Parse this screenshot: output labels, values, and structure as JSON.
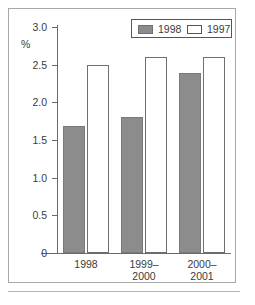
{
  "chart_data": {
    "type": "bar",
    "title": "",
    "subtitle": "",
    "xlabel": "",
    "ylabel": "%",
    "ylim": [
      0,
      3.0
    ],
    "yticks": [
      "0",
      "0.5",
      "1.0",
      "1.5",
      "2.0",
      "2.5",
      "3.0"
    ],
    "ytick_values": [
      0,
      0.5,
      1.0,
      1.5,
      2.0,
      2.5,
      3.0
    ],
    "grid": false,
    "legend_position": "top-right",
    "categories": [
      "1998",
      "1999–2000",
      "2000–2001"
    ],
    "category_lines": [
      [
        "1998"
      ],
      [
        "1999–",
        "2000"
      ],
      [
        "2000–",
        "2001"
      ]
    ],
    "series": [
      {
        "name": "1998",
        "style": "filled",
        "color": "#8c8c8c",
        "values": [
          1.68,
          1.8,
          2.39
        ]
      },
      {
        "name": "1997",
        "style": "open",
        "color": "#ffffff",
        "values": [
          2.49,
          2.6,
          2.6
        ]
      }
    ]
  },
  "legend": {
    "entries": [
      {
        "label": "1998",
        "swatch": "filled-gray-swatch"
      },
      {
        "label": "1997",
        "swatch": "open-white-swatch"
      }
    ]
  },
  "axis": {
    "unit_label": "%"
  },
  "colors": {
    "series_1998_fill": "#8c8c8c",
    "series_1998_border": "#7a7a7a",
    "series_1997_fill": "#ffffff",
    "series_1997_border": "#6f6f6f",
    "axis_line": "#6a6a6a",
    "text": "#3b3b3b",
    "frame_border": "#a8a8a8",
    "background": "#ffffff"
  }
}
